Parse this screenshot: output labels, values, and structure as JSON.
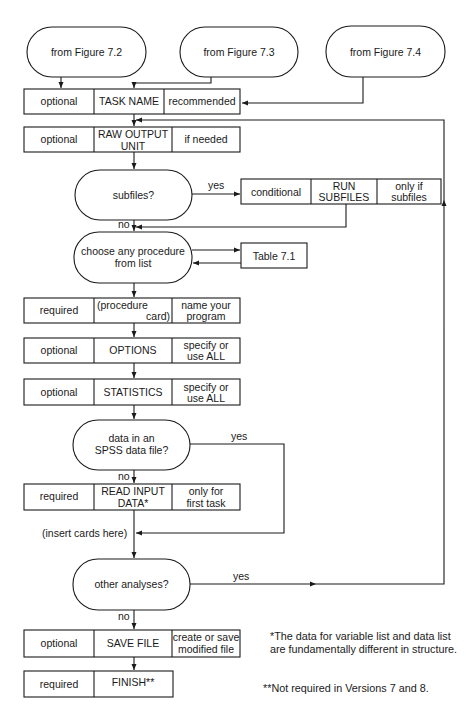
{
  "terminals": {
    "fig72": "from Figure 7.2",
    "fig73": "from Figure 7.3",
    "fig74": "from Figure 7.4"
  },
  "rows": {
    "task_name": {
      "status": "optional",
      "command": "TASK NAME",
      "note": "recommended"
    },
    "raw_output": {
      "status": "optional",
      "command1": "RAW OUTPUT",
      "command2": "UNIT",
      "note": "if needed"
    },
    "run_subfiles": {
      "status": "conditional",
      "command1": "RUN",
      "command2": "SUBFILES",
      "note1": "only if",
      "note2": "subfiles"
    },
    "procedure": {
      "status": "required",
      "command1": "(procedure",
      "command2": "card)",
      "note1": "name your",
      "note2": "program"
    },
    "options": {
      "status": "optional",
      "command": "OPTIONS",
      "note1": "specify or",
      "note2": "use ALL"
    },
    "statistics": {
      "status": "optional",
      "command": "STATISTICS",
      "note1": "specify or",
      "note2": "use ALL"
    },
    "read_input": {
      "status": "required",
      "command1": "READ INPUT",
      "command2": "DATA*",
      "note1": "only for",
      "note2": "first task"
    },
    "save_file": {
      "status": "optional",
      "command": "SAVE FILE",
      "note1": "create or save",
      "note2": "modified file"
    },
    "finish": {
      "status": "required",
      "command": "FINISH**"
    }
  },
  "decisions": {
    "subfiles": "subfiles?",
    "choose1": "choose any procedure",
    "choose2": "from list",
    "data1": "data in an",
    "data2": "SPSS data file?",
    "other": "other analyses?"
  },
  "reference_box": "Table 7.1",
  "labels": {
    "yes": "yes",
    "no": "no",
    "insert_cards": "(insert cards here)"
  },
  "footnotes": {
    "single": "*The data for variable list and data list are fundamentally different in structure.",
    "double": "**Not required in Versions 7 and 8."
  }
}
